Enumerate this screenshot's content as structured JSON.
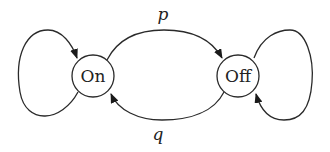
{
  "diagram": {
    "type": "state-transition",
    "nodes": [
      {
        "id": "on",
        "label": "On"
      },
      {
        "id": "off",
        "label": "Off"
      }
    ],
    "edges": [
      {
        "from": "on",
        "to": "off",
        "label": "p"
      },
      {
        "from": "off",
        "to": "on",
        "label": "q"
      },
      {
        "from": "on",
        "to": "on",
        "label": ""
      },
      {
        "from": "off",
        "to": "off",
        "label": ""
      }
    ],
    "colors": {
      "stroke": "#2a2a2a",
      "text": "#222222",
      "background": "#ffffff"
    }
  }
}
